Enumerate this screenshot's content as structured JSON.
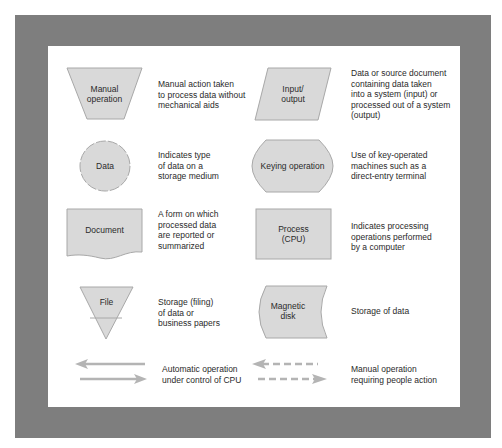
{
  "colors": {
    "frame": "#7e7e7e",
    "panel": "#ffffff",
    "shape_fill": "#d9d9d9",
    "shape_stroke": "#a8a8a8",
    "arrow": "#b4b4b4",
    "text": "#2a2a2a"
  },
  "symbols": [
    {
      "id": "manual-operation",
      "label": "Manual\noperation",
      "description": "Manual action taken\nto process data without\nmechanical aids"
    },
    {
      "id": "input-output",
      "label": "Input/\noutput",
      "description": "Data or source document\ncontaining data taken\ninto a system (input) or\nprocessed out of a system\n(output)"
    },
    {
      "id": "data",
      "label": "Data",
      "description": "Indicates type\nof data on a\nstorage medium"
    },
    {
      "id": "keying-operation",
      "label": "Keying operation",
      "description": "Use of key-operated\nmachines such as a\ndirect-entry terminal"
    },
    {
      "id": "document",
      "label": "Document",
      "description": "A form on which\nprocessed data\nare reported or\nsummarized"
    },
    {
      "id": "process",
      "label": "Process\n(CPU)",
      "description": "Indicates processing\noperations performed\nby a computer"
    },
    {
      "id": "file",
      "label": "File",
      "description": "Storage (filing)\nof data or\nbusiness papers"
    },
    {
      "id": "magnetic-disk",
      "label": "Magnetic\ndisk",
      "description": "Storage of data"
    },
    {
      "id": "automatic-operation-arrows",
      "label": "",
      "description": "Automatic operation\nunder control of CPU"
    },
    {
      "id": "manual-operation-arrows",
      "label": "",
      "description": "Manual operation\nrequiring people action"
    }
  ]
}
